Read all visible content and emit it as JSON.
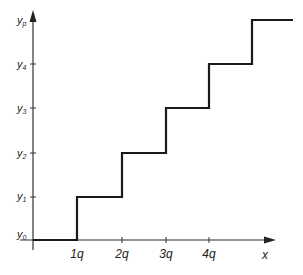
{
  "diagram": {
    "type": "step-function",
    "x_axis": {
      "label": "x",
      "ticks": [
        {
          "label": "1q",
          "x": 77
        },
        {
          "label": "2q",
          "x": 122
        },
        {
          "label": "3q",
          "x": 166
        },
        {
          "label": "4q",
          "x": 209
        }
      ]
    },
    "y_axis": {
      "ticks": [
        {
          "base": "y",
          "sub": "0",
          "y": 240
        },
        {
          "base": "y",
          "sub": "1",
          "y": 197
        },
        {
          "base": "y",
          "sub": "2",
          "y": 153
        },
        {
          "base": "y",
          "sub": "3",
          "y": 108
        },
        {
          "base": "y",
          "sub": "4",
          "y": 64
        },
        {
          "base": "y",
          "sub": "p",
          "y": 20
        }
      ]
    },
    "steps": [
      {
        "from": "0",
        "to": "1q",
        "level": "y0"
      },
      {
        "from": "1q",
        "to": "2q",
        "level": "y1"
      },
      {
        "from": "2q",
        "to": "3q",
        "level": "y2"
      },
      {
        "from": "3q",
        "to": "4q",
        "level": "y3"
      },
      {
        "from": "4q",
        "to": "5q",
        "level": "y4"
      },
      {
        "from": "5q",
        "to": "end",
        "level": "yp"
      }
    ],
    "colors": {
      "line": "#1a1a1a",
      "axis": "#333333",
      "background": "#ffffff"
    }
  }
}
